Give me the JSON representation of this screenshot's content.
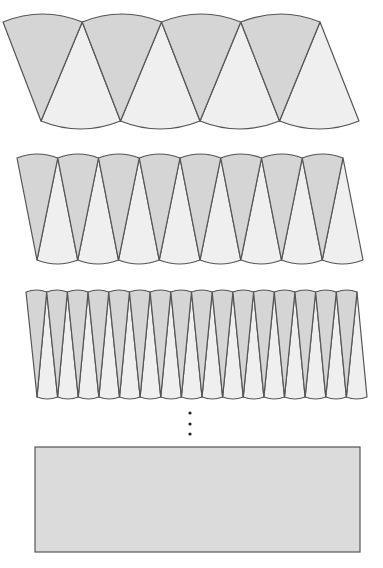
{
  "figure": {
    "width": 383,
    "height": 568,
    "colors": {
      "background": "#ffffff",
      "dark_sector": "#d5d5d5",
      "light_sector": "#efefef",
      "stroke": "#555555",
      "rectangle_fill": "#dbdbdb",
      "dots": "#222222"
    },
    "rows": [
      {
        "id": "row-8-sectors",
        "pairs": 4,
        "top_y": 22,
        "bottom_y": 121,
        "top_x_start": 3,
        "top_x_end": 320,
        "bottom_x_start": 41,
        "bottom_x_end": 359,
        "bulge": 8
      },
      {
        "id": "row-16-sectors",
        "pairs": 8,
        "top_y": 158,
        "bottom_y": 260,
        "top_x_start": 17,
        "top_x_end": 343,
        "bottom_x_start": 37,
        "bottom_x_end": 363,
        "bulge": 4
      },
      {
        "id": "row-32-sectors",
        "pairs": 16,
        "top_y": 292,
        "bottom_y": 397,
        "top_x_start": 26,
        "top_x_end": 357,
        "bottom_x_start": 37,
        "bottom_x_end": 367,
        "bulge": 2
      }
    ],
    "ellipsis_dots": [
      {
        "x": 190,
        "y": 413
      },
      {
        "x": 190,
        "y": 424
      },
      {
        "x": 190,
        "y": 434
      }
    ],
    "limit_rectangle": {
      "x": 35,
      "y": 447,
      "width": 325,
      "height": 105
    }
  }
}
